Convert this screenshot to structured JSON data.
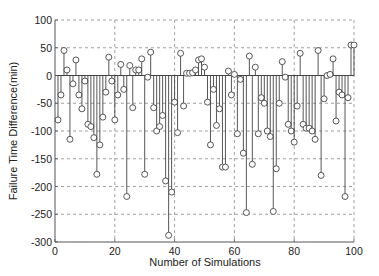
{
  "chart_data": {
    "type": "stem",
    "title": "",
    "xlabel": "Number of Simulations",
    "ylabel": "Failure Time Difference(min)",
    "xlim": [
      0,
      100
    ],
    "ylim": [
      -300,
      100
    ],
    "xticks": [
      0,
      20,
      40,
      60,
      80,
      100
    ],
    "yticks": [
      100,
      50,
      0,
      -50,
      -100,
      -150,
      -200,
      -250,
      -300
    ],
    "grid": true,
    "legend": null,
    "x": [
      1,
      2,
      3,
      4,
      5,
      6,
      7,
      8,
      9,
      10,
      11,
      12,
      13,
      14,
      15,
      16,
      17,
      18,
      19,
      20,
      21,
      22,
      23,
      24,
      25,
      26,
      27,
      28,
      29,
      30,
      31,
      32,
      33,
      34,
      35,
      36,
      37,
      38,
      39,
      40,
      41,
      42,
      43,
      44,
      45,
      46,
      47,
      48,
      49,
      50,
      51,
      52,
      53,
      54,
      55,
      56,
      57,
      58,
      59,
      60,
      61,
      62,
      63,
      64,
      65,
      66,
      67,
      68,
      69,
      70,
      71,
      72,
      73,
      74,
      75,
      76,
      77,
      78,
      79,
      80,
      81,
      82,
      83,
      84,
      85,
      86,
      87,
      88,
      89,
      90,
      91,
      92,
      93,
      94,
      95,
      96,
      97,
      98,
      99,
      100
    ],
    "values": [
      -80,
      -35,
      45,
      10,
      -115,
      -15,
      28,
      -35,
      -60,
      -10,
      -88,
      -92,
      -112,
      -178,
      -125,
      -75,
      -30,
      33,
      -10,
      -80,
      -35,
      20,
      -25,
      -218,
      18,
      -58,
      10,
      10,
      30,
      -178,
      -3,
      42,
      -58,
      -100,
      -92,
      -72,
      -190,
      -288,
      -210,
      -48,
      -103,
      40,
      -55,
      4,
      4,
      5,
      10,
      28,
      30,
      15,
      -48,
      -125,
      -25,
      -90,
      -60,
      -165,
      -165,
      8,
      -35,
      2,
      -105,
      -7,
      -140,
      -247,
      35,
      -160,
      15,
      -105,
      -40,
      -50,
      -100,
      -110,
      -245,
      -168,
      -50,
      25,
      -3,
      -88,
      -100,
      -120,
      -55,
      40,
      -88,
      -95,
      -95,
      -100,
      -115,
      45,
      -180,
      -42,
      0,
      2,
      30,
      -82,
      -30,
      -35,
      -218,
      -40,
      55,
      55
    ]
  },
  "colors": {
    "stem": "#444444",
    "axis": "#555555",
    "grid": "#888888",
    "text": "#222222"
  }
}
